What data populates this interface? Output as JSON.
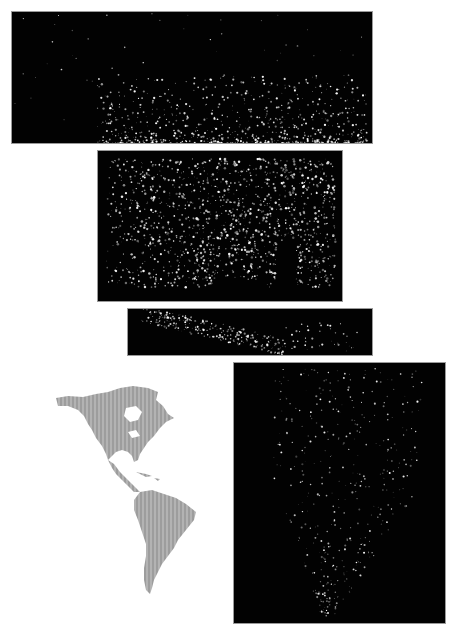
{
  "figure": {
    "panels": [
      {
        "id": "canada-alaska",
        "label": "Canada and Alaska at night",
        "bg": "#020202"
      },
      {
        "id": "usa",
        "label": "Contiguous United States at night",
        "bg": "#020202"
      },
      {
        "id": "central-america",
        "label": "Mexico, Central America and Caribbean at night",
        "bg": "#020202"
      },
      {
        "id": "south-america",
        "label": "South America at night",
        "bg": "#020202"
      }
    ],
    "locator": {
      "label": "Locator map of North and South America",
      "land_color": "#a9a9a9",
      "water_color": "#ffffff"
    },
    "colors": {
      "lights": "#ffffff",
      "night": "#020202",
      "page": "#ffffff"
    }
  }
}
